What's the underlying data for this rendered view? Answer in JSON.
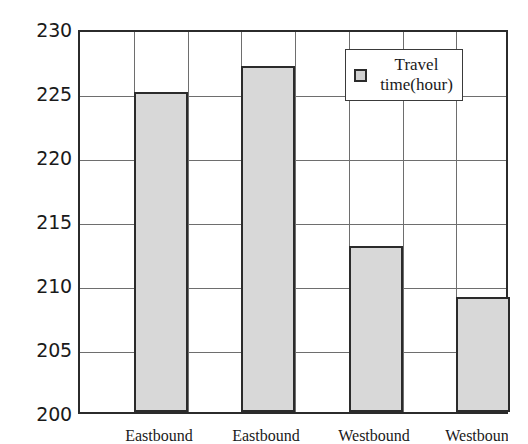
{
  "chart_data": {
    "type": "bar",
    "title": "",
    "subtitle": "",
    "xlabel": "",
    "ylabel": "",
    "categories": [
      "Eastbound",
      "Eastbound",
      "Westbound",
      "Westbound"
    ],
    "values": [
      225,
      227,
      213,
      209
    ],
    "series": [
      {
        "name": "Travel time(hour)",
        "values": [
          225,
          227,
          213,
          209
        ]
      }
    ],
    "ylim": [
      200,
      230
    ],
    "yticks": [
      200,
      205,
      210,
      215,
      220,
      225,
      230
    ],
    "ytick_labels": [
      "200",
      "205",
      "210",
      "215",
      "220",
      "225",
      "230"
    ],
    "grid": true,
    "grid_axis": "both",
    "legend": {
      "position": "upper right inside plot",
      "entries": [
        {
          "label_line1": "Travel",
          "label_line2": "time(hour)",
          "label": "Travel time(hour)",
          "marker": "filled-square-marker",
          "color": "#d0d0d0"
        }
      ]
    },
    "colors": {
      "bar_fill": "#d8d8d8",
      "bar_edge": "#2b2b2b",
      "axis": "#2b2b2b",
      "gridline": "#6e6e6e",
      "background": "#ffffff",
      "text": "#1a1a1a"
    }
  }
}
